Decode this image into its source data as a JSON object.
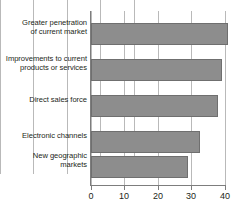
{
  "chart_data": {
    "type": "bar",
    "orientation": "horizontal",
    "title": "",
    "subtitle": "",
    "xlabel": "",
    "ylabel": "",
    "xlim": [
      0,
      40
    ],
    "xticks": [
      0,
      10,
      20,
      30,
      40
    ],
    "xticklabels": [
      "0",
      "10",
      "20",
      "30",
      "40"
    ],
    "grid": true,
    "grid_axis": "x",
    "legend": null,
    "legend_position": "none",
    "bar_color": "#8d8d8d",
    "bar_edge_color": "#6f6f6f",
    "axis_color": "#7d7d7d",
    "grid_color": "#b9b9b9",
    "categories": [
      "Greater penetration of current market",
      "Improvements to current products or services",
      "Direct sales force",
      "Electronic channels",
      "New geographic markets"
    ],
    "category_lines": [
      [
        "Greater penetration",
        "of current market"
      ],
      [
        "Improvements to current",
        "products or services"
      ],
      [
        "Direct sales force"
      ],
      [
        "Electronic channels"
      ],
      [
        "New geographic",
        "markets"
      ]
    ],
    "values": [
      41,
      39,
      38,
      32.5,
      29
    ]
  }
}
